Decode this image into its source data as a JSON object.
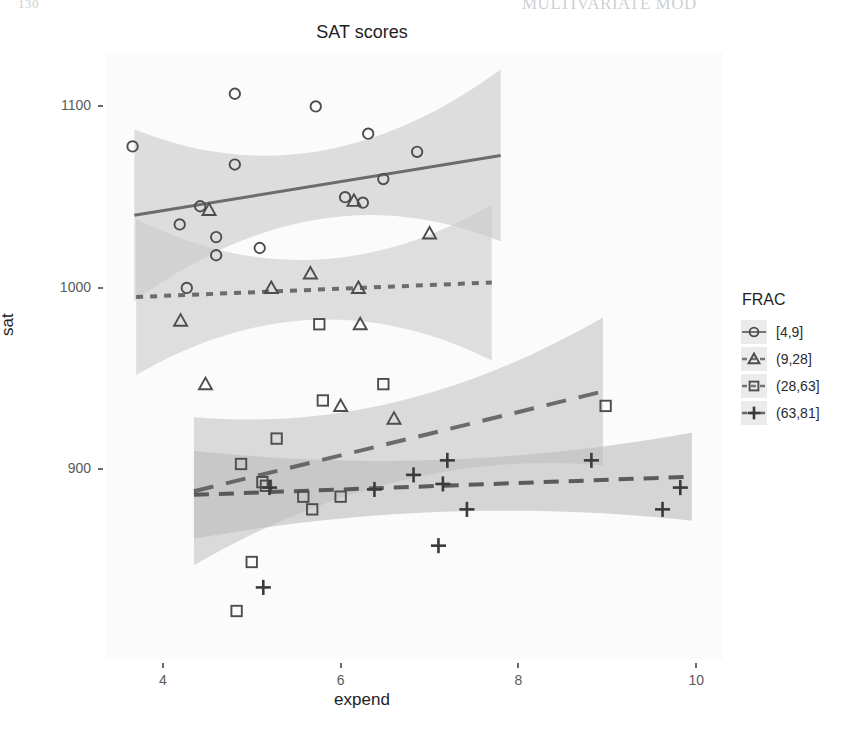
{
  "page": {
    "page_number": "130",
    "running_head": "MULTIVARIATE MOD"
  },
  "chart_data": {
    "type": "scatter",
    "title": "SAT scores",
    "xlabel": "expend",
    "ylabel": "sat",
    "xlim": [
      3.35,
      10.3
    ],
    "ylim": [
      795,
      1130
    ],
    "xticks": [
      4,
      6,
      8,
      10
    ],
    "yticks": [
      900,
      1000,
      1100
    ],
    "xtick_labels": [
      "4",
      "6",
      "8",
      "10"
    ],
    "ytick_labels": [
      "900",
      "1000",
      "1100"
    ],
    "grid": false,
    "legend": {
      "title": "FRAC",
      "position": "right",
      "entries": [
        {
          "label": "[4,9]",
          "symbol": "circle",
          "line": "solid"
        },
        {
          "label": "(9,28]",
          "symbol": "triangle",
          "line": "dotted"
        },
        {
          "label": "(28,63]",
          "symbol": "square",
          "line": "longdash"
        },
        {
          "label": "(63,81]",
          "symbol": "plus",
          "line": "dashed"
        }
      ]
    },
    "series": [
      {
        "name": "[4,9]",
        "symbol": "circle",
        "color": "#4d4d4d",
        "line_style": "solid",
        "points": [
          {
            "x": 4.81,
            "y": 1107
          },
          {
            "x": 5.72,
            "y": 1100
          },
          {
            "x": 6.31,
            "y": 1085
          },
          {
            "x": 3.66,
            "y": 1078
          },
          {
            "x": 6.86,
            "y": 1075
          },
          {
            "x": 4.81,
            "y": 1068
          },
          {
            "x": 6.48,
            "y": 1060
          },
          {
            "x": 4.42,
            "y": 1045
          },
          {
            "x": 6.05,
            "y": 1050
          },
          {
            "x": 6.25,
            "y": 1047
          },
          {
            "x": 4.19,
            "y": 1035
          },
          {
            "x": 4.6,
            "y": 1028
          },
          {
            "x": 5.09,
            "y": 1022
          },
          {
            "x": 4.6,
            "y": 1018
          },
          {
            "x": 4.27,
            "y": 1000
          }
        ],
        "fit": {
          "x0": 3.68,
          "y0": 1040,
          "x1": 7.8,
          "y1": 1073
        }
      },
      {
        "name": "(9,28]",
        "symbol": "triangle",
        "color": "#4d4d4d",
        "line_style": "dotted",
        "points": [
          {
            "x": 4.52,
            "y": 1043
          },
          {
            "x": 6.15,
            "y": 1048
          },
          {
            "x": 7.0,
            "y": 1030
          },
          {
            "x": 5.66,
            "y": 1008
          },
          {
            "x": 5.22,
            "y": 1000
          },
          {
            "x": 6.2,
            "y": 1000
          },
          {
            "x": 4.2,
            "y": 982
          },
          {
            "x": 6.22,
            "y": 980
          },
          {
            "x": 4.48,
            "y": 947
          },
          {
            "x": 6.0,
            "y": 935
          },
          {
            "x": 6.6,
            "y": 928
          }
        ],
        "fit": {
          "x0": 3.7,
          "y0": 995,
          "x1": 7.7,
          "y1": 1003
        }
      },
      {
        "name": "(28,63]",
        "symbol": "square",
        "color": "#4d4d4d",
        "line_style": "longdash",
        "points": [
          {
            "x": 5.76,
            "y": 980
          },
          {
            "x": 6.48,
            "y": 947
          },
          {
            "x": 5.8,
            "y": 938
          },
          {
            "x": 5.28,
            "y": 917
          },
          {
            "x": 4.88,
            "y": 903
          },
          {
            "x": 5.12,
            "y": 893
          },
          {
            "x": 5.16,
            "y": 891
          },
          {
            "x": 5.58,
            "y": 885
          },
          {
            "x": 6.0,
            "y": 885
          },
          {
            "x": 5.68,
            "y": 878
          },
          {
            "x": 5.0,
            "y": 849
          },
          {
            "x": 8.98,
            "y": 935
          },
          {
            "x": 4.83,
            "y": 822
          }
        ],
        "fit": {
          "x0": 4.35,
          "y0": 888,
          "x1": 8.95,
          "y1": 943
        }
      },
      {
        "name": "(63,81]",
        "symbol": "plus",
        "color": "#3a3a3a",
        "line_style": "dashed",
        "points": [
          {
            "x": 5.2,
            "y": 890
          },
          {
            "x": 6.38,
            "y": 889
          },
          {
            "x": 6.82,
            "y": 897
          },
          {
            "x": 7.2,
            "y": 905
          },
          {
            "x": 7.15,
            "y": 892
          },
          {
            "x": 7.42,
            "y": 878
          },
          {
            "x": 7.1,
            "y": 858
          },
          {
            "x": 8.82,
            "y": 905
          },
          {
            "x": 9.62,
            "y": 878
          },
          {
            "x": 9.82,
            "y": 890
          },
          {
            "x": 5.13,
            "y": 835
          }
        ],
        "fit": {
          "x0": 4.35,
          "y0": 886,
          "x1": 9.95,
          "y1": 896
        }
      }
    ]
  }
}
